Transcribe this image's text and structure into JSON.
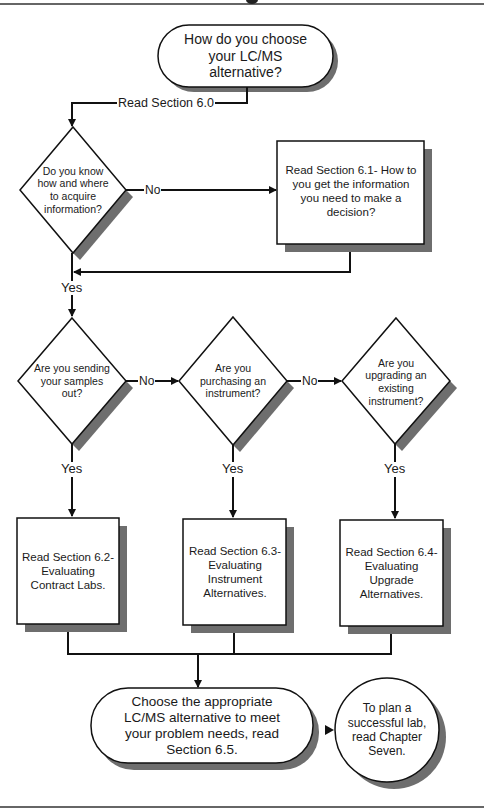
{
  "flowchart": {
    "start": {
      "label": "How do you choose your LC/MS alternative?"
    },
    "edge_start_to_q1": {
      "label": "Read Section 6.0"
    },
    "q1": {
      "label": "Do  you know how and where to acquire information?"
    },
    "q1_no_edge": {
      "label": "No"
    },
    "box_6_1": {
      "label": "Read Section 6.1- How  to you get the information you need to make a decision?"
    },
    "q1_yes_edge": {
      "label": "Yes"
    },
    "q2": {
      "label": "Are you sending your samples out?"
    },
    "q2_no_edge": {
      "label": "No"
    },
    "q2_yes_edge": {
      "label": "Yes"
    },
    "q3": {
      "label": "Are you purchasing an instrument?"
    },
    "q3_no_edge": {
      "label": "No"
    },
    "q3_yes_edge": {
      "label": "Yes"
    },
    "q4": {
      "label": "Are you upgrading an existing instrument?"
    },
    "q4_yes_edge": {
      "label": "Yes"
    },
    "box_6_2": {
      "label": "Read Section 6.2- Evaluating Contract Labs."
    },
    "box_6_3": {
      "label": "Read Section 6.3- Evaluating Instrument Alternatives."
    },
    "box_6_4": {
      "label": "Read Section 6.4- Evaluating Upgrade Alternatives."
    },
    "end": {
      "label": "Choose the appropriate LC/MS alternative to meet your problem needs, read Section 6.5."
    },
    "next": {
      "label": "To plan a successful lab, read Chapter Seven."
    }
  },
  "colors": {
    "stroke": "#111111",
    "shadow": "#6e6e6e",
    "fill": "#ffffff"
  }
}
